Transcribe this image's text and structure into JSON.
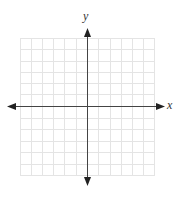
{
  "diagram": {
    "type": "coordinate-plane",
    "axes": {
      "x_label": "x",
      "y_label": "y"
    },
    "grid": {
      "columns": 12,
      "rows": 12,
      "line_color": "#e2e2e2",
      "axis_color": "#444444"
    }
  }
}
